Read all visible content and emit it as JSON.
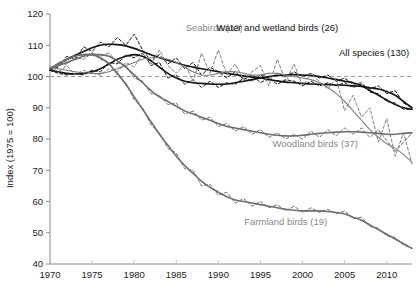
{
  "chart_data": {
    "type": "line",
    "title": "",
    "xlabel": "",
    "ylabel": "Index (1975 = 100)",
    "xlim": [
      1970,
      2013
    ],
    "ylim": [
      40,
      120
    ],
    "yticks": [
      40,
      50,
      60,
      70,
      80,
      90,
      100,
      110,
      120
    ],
    "xticks": [
      1970,
      1975,
      1980,
      1985,
      1990,
      1995,
      2000,
      2005,
      2010
    ],
    "xtick_labels": [
      "1970",
      "1975",
      "1980",
      "1985",
      "1990",
      "1995",
      "2000",
      "2005",
      "2010"
    ],
    "ytick_labels": [
      "40",
      "50",
      "60",
      "70",
      "80",
      "90",
      "100",
      "110",
      "120"
    ],
    "grid": false,
    "legend_position": "inline-annotations",
    "reference_line": {
      "value": 100,
      "style": "dashed",
      "color": "#9a9a9a"
    },
    "annotations": [
      {
        "text": "Seabirds (13)",
        "x": 1989.5,
        "y": 114.5,
        "color": "#888888"
      },
      {
        "text": "Water and wetland birds (26)",
        "x": 1997.0,
        "y": 114.5,
        "color": "#111111"
      },
      {
        "text": "All species (130)",
        "x": 2008.5,
        "y": 106.5,
        "color": "#111111"
      },
      {
        "text": "Woodland birds (37)",
        "x": 2001.5,
        "y": 77.5,
        "color": "#888888"
      },
      {
        "text": "Farmland birds (19)",
        "x": 1998.0,
        "y": 52.5,
        "color": "#888888"
      }
    ],
    "x": [
      1970,
      1971,
      1972,
      1973,
      1974,
      1975,
      1976,
      1977,
      1978,
      1979,
      1980,
      1981,
      1982,
      1983,
      1984,
      1985,
      1986,
      1987,
      1988,
      1989,
      1990,
      1991,
      1992,
      1993,
      1994,
      1995,
      1996,
      1997,
      1998,
      1999,
      2000,
      2001,
      2002,
      2003,
      2004,
      2005,
      2006,
      2007,
      2008,
      2009,
      2010,
      2011,
      2012,
      2013
    ],
    "series": [
      {
        "name": "All species (130)",
        "color": "#111111",
        "style": "solid-smoothed",
        "values": [
          102.5,
          104.0,
          105.5,
          106.8,
          108.0,
          109.2,
          110.0,
          110.3,
          110.2,
          109.8,
          109.0,
          108.0,
          107.0,
          106.0,
          105.2,
          104.4,
          103.6,
          103.0,
          102.5,
          102.0,
          101.5,
          101.0,
          100.6,
          100.2,
          99.8,
          99.5,
          99.0,
          98.6,
          98.2,
          98.0,
          97.8,
          97.6,
          97.5,
          97.4,
          97.3,
          97.2,
          97.0,
          96.8,
          96.4,
          96.0,
          95.2,
          94.0,
          92.0,
          90.0
        ],
        "raw": [
          102.0,
          103.0,
          106.5,
          105.5,
          109.5,
          108.0,
          111.0,
          109.5,
          112.5,
          110.0,
          113.5,
          108.5,
          105.0,
          107.0,
          104.0,
          106.0,
          102.5,
          104.5,
          100.5,
          103.0,
          101.5,
          99.5,
          101.5,
          99.0,
          100.5,
          98.0,
          99.5,
          97.5,
          99.0,
          98.5,
          97.0,
          98.5,
          97.0,
          98.0,
          97.0,
          98.0,
          96.5,
          97.5,
          96.0,
          97.0,
          94.5,
          95.5,
          91.5,
          90.0
        ]
      },
      {
        "name": "Water and wetland birds (26)",
        "color": "#111111",
        "style": "solid-smoothed",
        "values": [
          102.0,
          101.5,
          101.0,
          100.8,
          101.0,
          101.5,
          102.5,
          104.0,
          105.5,
          106.5,
          107.0,
          106.5,
          105.0,
          103.0,
          101.0,
          99.5,
          98.5,
          98.0,
          97.8,
          97.6,
          97.5,
          97.6,
          98.0,
          98.5,
          99.0,
          99.5,
          100.0,
          100.3,
          100.5,
          100.6,
          100.5,
          100.3,
          100.0,
          99.5,
          99.0,
          98.5,
          98.0,
          97.0,
          95.5,
          94.0,
          92.5,
          91.0,
          90.0,
          89.5
        ],
        "raw": [
          102.0,
          101.0,
          100.5,
          101.0,
          100.5,
          102.0,
          101.5,
          104.5,
          104.0,
          107.0,
          106.0,
          107.5,
          103.5,
          104.5,
          99.5,
          100.5,
          97.5,
          99.0,
          96.5,
          98.5,
          96.5,
          98.0,
          97.5,
          99.5,
          98.5,
          100.5,
          99.5,
          101.0,
          100.0,
          101.5,
          100.0,
          101.0,
          99.5,
          100.5,
          98.5,
          99.5,
          97.5,
          98.0,
          95.0,
          94.5,
          92.0,
          91.5,
          89.5,
          89.5
        ]
      },
      {
        "name": "Seabirds (13)",
        "color": "#7d7d7d",
        "style": "dashed-raw",
        "values": [
          103.0,
          102.5,
          102.0,
          101.5,
          101.2,
          101.0,
          101.0,
          101.5,
          102.5,
          103.5,
          104.5,
          105.5,
          106.0,
          106.0,
          105.5,
          104.5,
          103.0,
          101.5,
          100.5,
          100.5,
          101.0,
          101.5,
          101.5,
          101.0,
          100.5,
          100.5,
          101.0,
          101.0,
          100.5,
          100.0,
          99.5,
          99.0,
          98.0,
          96.5,
          94.5,
          92.0,
          89.0,
          86.0,
          83.0,
          80.5,
          78.5,
          77.0,
          75.0,
          72.5
        ],
        "raw": [
          103.0,
          101.5,
          103.5,
          100.5,
          102.0,
          101.0,
          100.5,
          102.5,
          101.5,
          104.5,
          103.0,
          107.5,
          104.0,
          108.5,
          103.5,
          101.0,
          104.0,
          98.5,
          107.5,
          101.0,
          108.5,
          100.5,
          104.0,
          99.0,
          101.5,
          103.5,
          97.0,
          105.5,
          98.5,
          104.0,
          97.0,
          101.0,
          98.5,
          96.0,
          99.5,
          89.0,
          94.0,
          87.0,
          90.0,
          79.0,
          86.5,
          74.5,
          82.0,
          72.0
        ]
      },
      {
        "name": "Woodland birds (37)",
        "color": "#6e6e6e",
        "style": "solid-smoothed",
        "values": [
          102.5,
          103.5,
          104.5,
          105.5,
          106.5,
          107.0,
          107.0,
          106.5,
          105.0,
          103.0,
          100.5,
          98.0,
          95.5,
          93.5,
          92.0,
          90.5,
          89.0,
          88.0,
          87.0,
          86.0,
          85.0,
          84.0,
          83.5,
          83.0,
          82.5,
          82.0,
          81.5,
          81.2,
          81.0,
          81.0,
          81.2,
          81.5,
          81.8,
          82.0,
          82.2,
          82.3,
          82.3,
          82.2,
          82.0,
          81.8,
          81.5,
          81.5,
          81.8,
          82.0
        ],
        "raw": [
          102.5,
          104.0,
          104.0,
          106.0,
          105.5,
          107.5,
          106.5,
          107.5,
          104.5,
          103.5,
          99.5,
          98.5,
          94.5,
          94.0,
          91.0,
          91.5,
          88.0,
          89.0,
          86.0,
          87.0,
          84.0,
          85.0,
          82.5,
          84.0,
          81.5,
          83.0,
          80.5,
          82.0,
          80.0,
          81.5,
          80.0,
          82.5,
          80.5,
          83.0,
          81.0,
          83.5,
          81.5,
          83.5,
          80.5,
          83.0,
          79.5,
          76.0,
          79.0,
          82.0
        ]
      },
      {
        "name": "Farmland birds (19)",
        "color": "#6e6e6e",
        "style": "solid-smoothed",
        "values": [
          102.5,
          104.0,
          105.5,
          106.5,
          107.0,
          107.0,
          106.0,
          104.0,
          101.0,
          97.5,
          93.5,
          89.5,
          85.5,
          81.5,
          78.0,
          74.5,
          71.5,
          69.0,
          66.5,
          64.5,
          63.0,
          61.5,
          60.5,
          60.0,
          59.5,
          59.0,
          58.5,
          58.0,
          57.5,
          57.2,
          57.0,
          57.0,
          57.0,
          56.8,
          56.5,
          56.0,
          55.0,
          54.0,
          52.5,
          51.0,
          49.5,
          48.0,
          46.5,
          45.0
        ],
        "raw": [
          102.5,
          104.5,
          105.0,
          107.0,
          106.5,
          107.5,
          105.5,
          104.5,
          100.5,
          98.0,
          92.5,
          90.0,
          84.5,
          82.0,
          77.0,
          75.5,
          70.5,
          70.0,
          65.0,
          65.5,
          62.0,
          63.0,
          59.5,
          61.0,
          58.5,
          60.0,
          58.0,
          59.0,
          57.0,
          58.5,
          56.5,
          58.0,
          56.5,
          57.5,
          56.0,
          57.0,
          54.5,
          55.0,
          52.0,
          51.5,
          49.0,
          48.5,
          46.0,
          45.0
        ]
      }
    ]
  }
}
